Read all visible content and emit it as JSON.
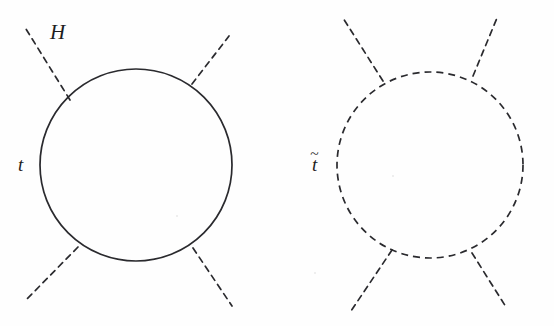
{
  "figure": {
    "domain": "Diagram",
    "kind": "feynman-diagram-pair",
    "background_color": "#fefefe",
    "ink_color": "#2a2a2e",
    "width": 554,
    "height": 326
  },
  "diagrams": [
    {
      "id": "top-quark-loop",
      "name": "top quark loop diagram",
      "loop": {
        "name": "top-quark-loop-circle",
        "line_style": "solid",
        "cx": 136,
        "cy": 165,
        "r": 96,
        "stroke_width": 1.7
      },
      "legs": [
        {
          "name": "higgs-leg-upper-left",
          "line_style": "dashed",
          "x1": 70,
          "y1": 100,
          "x2": 26,
          "y2": 29
        },
        {
          "name": "higgs-leg-upper-right",
          "line_style": "dashed",
          "x1": 192,
          "y1": 84,
          "x2": 229,
          "y2": 36
        },
        {
          "name": "higgs-leg-lower-left",
          "line_style": "dashed",
          "x1": 78,
          "y1": 247,
          "x2": 25,
          "y2": 301
        },
        {
          "name": "higgs-leg-lower-right",
          "line_style": "dashed",
          "x1": 193,
          "y1": 248,
          "x2": 232,
          "y2": 306
        }
      ],
      "labels": [
        {
          "name": "higgs-label",
          "text": "H",
          "tilde": false,
          "x": 50,
          "y": 22,
          "size": "big"
        },
        {
          "name": "top-quark-label",
          "text": "t",
          "tilde": false,
          "x": 18,
          "y": 155,
          "size": "small"
        }
      ]
    },
    {
      "id": "stop-squark-loop",
      "name": "stop squark loop diagram",
      "loop": {
        "name": "stop-squark-loop-circle",
        "line_style": "dashed",
        "cx": 430,
        "cy": 165,
        "r": 93,
        "stroke_width": 1.7
      },
      "legs": [
        {
          "name": "higgs-leg-upper-left",
          "line_style": "dashed",
          "x1": 383,
          "y1": 81,
          "x2": 343,
          "y2": 18
        },
        {
          "name": "higgs-leg-upper-right",
          "line_style": "dashed",
          "x1": 473,
          "y1": 76,
          "x2": 497,
          "y2": 18
        },
        {
          "name": "higgs-leg-lower-left",
          "line_style": "dashed",
          "x1": 392,
          "y1": 250,
          "x2": 351,
          "y2": 311
        },
        {
          "name": "higgs-leg-lower-right",
          "line_style": "dashed",
          "x1": 472,
          "y1": 253,
          "x2": 506,
          "y2": 307
        }
      ],
      "labels": [
        {
          "name": "stop-squark-label",
          "text": "t",
          "tilde": true,
          "tilde_glyph": "~",
          "x": 312,
          "y": 155,
          "size": "small"
        }
      ]
    }
  ],
  "style": {
    "dash_pattern_leg": "6 5",
    "dash_pattern_loop": "7 5"
  }
}
